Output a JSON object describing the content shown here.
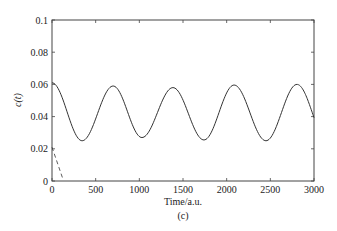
{
  "chart_data": {
    "type": "line",
    "title": "",
    "subtitle": "(c)",
    "xlabel": "Time/a.u.",
    "ylabel": "c(t)",
    "xlim": [
      0,
      3000
    ],
    "ylim": [
      0,
      0.1
    ],
    "xticks": [
      0,
      500,
      1000,
      1500,
      2000,
      2500,
      3000
    ],
    "xtick_labels": [
      "0",
      "500",
      "1000",
      "1500",
      "2000",
      "2500",
      "3000"
    ],
    "yticks": [
      0,
      0.02,
      0.04,
      0.06,
      0.08,
      0.1
    ],
    "ytick_labels": [
      "0",
      "0.02",
      "0.04",
      "0.06",
      "0.08",
      "0.1"
    ],
    "grid": false,
    "legend": null,
    "series": [
      {
        "name": "solid",
        "style": "solid",
        "color": "#333333",
        "x": [
          0,
          345,
          700,
          1030,
          1385,
          1740,
          2085,
          2450,
          2805,
          3000
        ],
        "y": [
          0.061,
          0.025,
          0.059,
          0.027,
          0.058,
          0.0255,
          0.0596,
          0.025,
          0.06,
          0.039
        ],
        "note": "oscillation with period ~700 a.u."
      },
      {
        "name": "dashed",
        "style": "dashed",
        "color": "#333333",
        "x": [
          0,
          120
        ],
        "y": [
          0.021,
          0.002
        ]
      }
    ]
  }
}
